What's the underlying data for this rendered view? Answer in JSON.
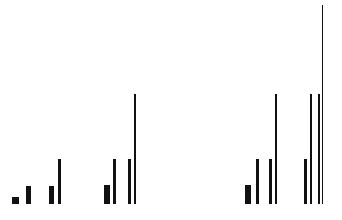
{
  "chart_data": {
    "type": "bar",
    "title": "",
    "xlabel": "",
    "ylabel": "",
    "grid": false,
    "legend": null,
    "baseline_y": 204,
    "color": "#111111",
    "groups": [
      {
        "name": "group-1",
        "bars": [
          {
            "x": 12,
            "width": 7,
            "height": 7
          },
          {
            "x": 26,
            "width": 5,
            "height": 18
          },
          {
            "x": 49,
            "width": 5,
            "height": 18
          },
          {
            "x": 58,
            "width": 3,
            "height": 45
          }
        ]
      },
      {
        "name": "group-2",
        "bars": [
          {
            "x": 104,
            "width": 6,
            "height": 19
          },
          {
            "x": 113,
            "width": 3,
            "height": 45
          },
          {
            "x": 128,
            "width": 3,
            "height": 45
          },
          {
            "x": 134,
            "width": 2,
            "height": 110
          }
        ]
      },
      {
        "name": "group-3",
        "bars": [
          {
            "x": 245,
            "width": 6,
            "height": 19
          },
          {
            "x": 256,
            "width": 3,
            "height": 45
          },
          {
            "x": 269,
            "width": 3,
            "height": 45
          },
          {
            "x": 275,
            "width": 2,
            "height": 110
          }
        ]
      },
      {
        "name": "group-4",
        "bars": [
          {
            "x": 304,
            "width": 3,
            "height": 45
          },
          {
            "x": 310,
            "width": 2,
            "height": 110
          },
          {
            "x": 318,
            "width": 2,
            "height": 110
          },
          {
            "x": 322,
            "width": 1,
            "height": 199
          }
        ]
      }
    ],
    "relative_levels": [
      7,
      18,
      45,
      110,
      199
    ]
  }
}
